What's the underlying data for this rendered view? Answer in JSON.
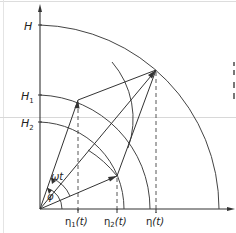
{
  "figure": {
    "colors": {
      "line": "#333333",
      "background": "#ffffff",
      "guide": "#d8d8d8"
    },
    "axes": {
      "y_labels": {
        "H": "H",
        "H1_main": "H",
        "H1_sub": "1",
        "H2_main": "H",
        "H2_sub": "2"
      },
      "x_labels": {
        "eta1_main": "η",
        "eta1_sub": "1",
        "eta1_arg": "(t)",
        "eta2_main": "η",
        "eta2_sub": "2",
        "eta2_arg": "(t)",
        "eta_main": "η",
        "eta_arg": "(t)"
      }
    },
    "angles": {
      "phi": "φ",
      "omega_t": "ωt"
    }
  }
}
